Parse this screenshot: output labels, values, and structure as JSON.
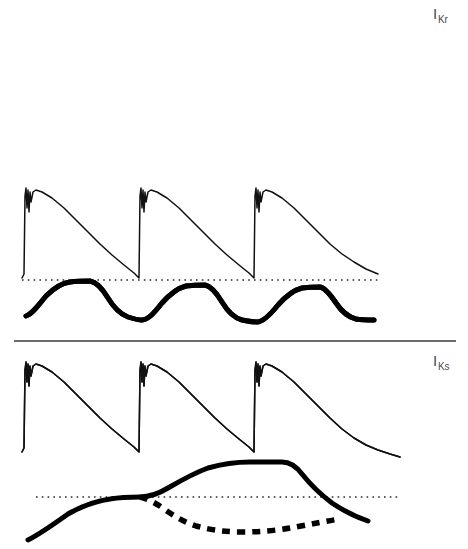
{
  "figure": {
    "background": "#ffffff",
    "ink_color": "#111111",
    "width": 468,
    "height": 549
  },
  "labels": {
    "ikr": {
      "symbol": "I",
      "subscript": "Kr",
      "full": "IKr"
    },
    "iks": {
      "symbol": "I",
      "subscript": "Ks",
      "full": "IKs"
    }
  },
  "panels": [
    {
      "id": "panel-ikr-slow",
      "label_ref": "ikr",
      "pacing": "slow",
      "beat_count": 2,
      "has_baseline": false,
      "traces": [
        {
          "name": "action-potential",
          "style": "thin-solid"
        },
        {
          "name": "current-ikr",
          "style": "thick-solid"
        }
      ]
    },
    {
      "id": "panel-ikr-fast",
      "label_ref": null,
      "pacing": "fast",
      "beat_count": 3,
      "has_baseline": true,
      "traces": [
        {
          "name": "action-potential",
          "style": "thin-solid"
        },
        {
          "name": "current-ikr",
          "style": "thick-solid"
        }
      ]
    },
    {
      "id": "panel-iks-fast",
      "label_ref": "iks",
      "pacing": "fast",
      "beat_count": 3,
      "has_baseline": true,
      "traces": [
        {
          "name": "action-potential",
          "style": "thin-solid"
        },
        {
          "name": "current-iks-control",
          "style": "thick-solid"
        },
        {
          "name": "current-iks-blocked",
          "style": "thick-dashed"
        }
      ]
    }
  ],
  "chart_data": {
    "type": "line",
    "title": "",
    "xlabel": "",
    "ylabel": "",
    "grid": false,
    "legend": "none",
    "annotations": [
      "IKr",
      "IKs"
    ],
    "panels": [
      {
        "name": "IKr slow pacing",
        "beat_onsets": [
          25,
          195
        ],
        "ap_baseline_y": 98,
        "ap_peak_y": 16,
        "current_baseline_y": 130,
        "current_peak_y": 108,
        "series": [
          {
            "name": "action-potential",
            "path": "M22,98 L24,96 L25,18 L26,12 L27,30 L28,14 L29,33 L30,16 L31,24 L33,16 L36,14 L42,15 L52,19 L64,26 L76,35 L88,46 L100,59 L112,71 L124,81 L136,88 L150,93 L165,95 L180,96 L192,97 L193,98 L194,96 L195,18 L196,12 L197,31 L198,13 L199,34 L200,16 L201,25 L203,16 L206,14 L212,15 L222,18 L234,25 L246,33 L258,43 L270,54 L284,66 L298,76 L312,84 L326,90 L340,94 L352,96"
          },
          {
            "name": "current-ikr",
            "path": "M28,136 C34,136 40,130 48,122 C56,115 62,110 70,109 C78,108 84,108 88,108 C92,108 96,112 100,119 C104,126 108,131 114,133 C120,134 130,134 144,134 C160,134 180,134 196,134 C202,134 206,128 212,120 C218,113 224,108 232,107 C240,106 246,106 250,107 C254,109 258,113 262,120 C266,127 272,131 280,133 C290,134 302,134 314,134"
          }
        ]
      },
      {
        "name": "IKr fast pacing",
        "beat_onsets": [
          25,
          140,
          255
        ],
        "ap_baseline_y": 278,
        "ap_peak_y": 190,
        "baseline_y": 280,
        "baseline_x_start": 22,
        "baseline_x_end": 380,
        "series": [
          {
            "name": "action-potential",
            "path": "M22,278 L24,274 L25,196 L26,188 L27,208 L28,190 L29,212 L30,192 L31,202 L33,192 L36,190 L42,192 L52,198 L64,208 L76,220 L88,232 L100,244 L112,255 L124,265 L134,273 L138,277 L139,278 L140,196 L141,188 L142,208 L143,190 L144,212 L145,192 L146,202 L148,192 L151,190 L157,192 L167,198 L179,208 L191,220 L203,232 L215,244 L227,255 L239,265 L249,273 L253,277 L254,278 L255,196 L256,188 L257,208 L258,190 L259,212 L260,192 L261,202 L263,192 L266,190 L272,192 L282,198 L294,208 L306,220 L318,232 L330,244 L342,254 L354,262 L366,269 L378,274"
          },
          {
            "name": "current-ikr",
            "path": "M26,316 C32,314 38,306 46,296 C54,288 62,283 70,282 C78,281 84,281 90,281 C96,282 102,288 108,298 C114,308 120,314 128,317 C134,319 138,320 142,320 C148,320 154,313 162,303 C170,294 178,288 186,286 C194,285 200,285 205,285 C210,286 216,292 222,302 C228,312 234,318 242,320 C248,321 252,322 257,322 C263,322 270,315 278,305 C286,296 294,290 302,288 C310,287 316,287 320,287 C325,288 330,294 336,303 C342,312 348,317 356,319 C362,320 368,320 374,320"
          }
        ]
      },
      {
        "name": "IKs fast pacing",
        "beat_onsets": [
          25,
          140,
          255
        ],
        "ap_baseline_y": 452,
        "ap_peak_y": 364,
        "baseline_y": 497,
        "baseline_x_start": 36,
        "baseline_x_end": 400,
        "series": [
          {
            "name": "action-potential",
            "path": "M22,452 L24,448 L25,370 L26,362 L27,382 L28,364 L29,386 L30,366 L31,376 L33,366 L36,364 L42,366 L52,372 L64,382 L76,394 L88,406 L100,418 L112,429 L124,439 L134,447 L138,451 L139,452 L140,370 L141,362 L142,382 L143,364 L144,386 L145,366 L146,376 L148,366 L151,364 L157,366 L167,372 L179,382 L191,394 L203,406 L215,418 L227,429 L239,439 L249,447 L253,451 L254,452 L255,370 L256,362 L257,382 L258,364 L259,386 L260,366 L261,376 L263,366 L266,364 L272,366 L282,372 L294,382 L306,394 L318,406 L330,418 L342,429 L354,438 L366,445 L378,450 L390,454 L400,457"
          },
          {
            "name": "current-iks-control",
            "path": "M28,540 C40,534 54,524 68,514 C82,506 96,501 110,499 C122,497 132,497 140,497 C150,497 158,494 168,488 C180,481 194,473 208,468 C222,464 236,462 250,462 C262,462 272,462 282,462 C290,462 296,466 302,474 C310,484 320,494 332,503 C344,511 356,517 368,521"
          },
          {
            "name": "current-iks-blocked",
            "path": "M140,497 C148,499 156,503 164,509 C174,516 184,522 196,526 C210,530 226,532 244,532 C262,532 280,530 296,527 C312,524 326,521 340,519"
          }
        ]
      }
    ]
  },
  "divider": {
    "y": 341,
    "x_start": 14,
    "x_end": 456
  }
}
